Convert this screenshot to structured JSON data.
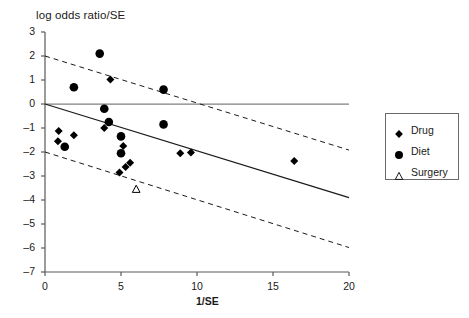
{
  "chart_data": {
    "type": "scatter",
    "title": "log odds ratio/SE",
    "xlabel": "1/SE",
    "ylabel": "",
    "xlim": [
      0,
      20
    ],
    "ylim": [
      -7,
      3
    ],
    "xticks": [
      "0",
      "5",
      "10",
      "15",
      "20"
    ],
    "xtick_values": [
      0,
      5,
      10,
      15,
      20
    ],
    "yticks": [
      "3",
      "2",
      "1",
      "0",
      "–1",
      "–2",
      "–3",
      "–4",
      "–5",
      "–6",
      "–7"
    ],
    "ytick_values": [
      3,
      2,
      1,
      0,
      -1,
      -2,
      -3,
      -4,
      -5,
      -6,
      -7
    ],
    "grid": false,
    "legend_position": "right-outside",
    "series": [
      {
        "name": "Drug",
        "marker": "filled-diamond",
        "color": "#000000",
        "points": [
          [
            4.3,
            1.02
          ],
          [
            0.9,
            -1.12
          ],
          [
            1.9,
            -1.3
          ],
          [
            0.85,
            -1.55
          ],
          [
            3.9,
            -1.0
          ],
          [
            5.15,
            -1.75
          ],
          [
            8.9,
            -2.05
          ],
          [
            9.6,
            -2.02
          ],
          [
            16.4,
            -2.37
          ],
          [
            5.6,
            -2.45
          ],
          [
            5.3,
            -2.62
          ],
          [
            4.9,
            -2.85
          ]
        ]
      },
      {
        "name": "Diet",
        "marker": "filled-circle",
        "color": "#000000",
        "points": [
          [
            3.6,
            2.1
          ],
          [
            1.9,
            0.7
          ],
          [
            7.8,
            0.6
          ],
          [
            3.9,
            -0.2
          ],
          [
            4.2,
            -0.75
          ],
          [
            7.8,
            -0.85
          ],
          [
            5.0,
            -1.35
          ],
          [
            5.0,
            -2.05
          ],
          [
            1.3,
            -1.78
          ]
        ]
      },
      {
        "name": "Surgery",
        "marker": "open-triangle",
        "color": "#000000",
        "points": [
          [
            6.0,
            -3.55
          ]
        ]
      }
    ],
    "lines": [
      {
        "name": "zero-reference-line",
        "style": "solid",
        "color": "#808080",
        "x0": 0,
        "y0": 0,
        "x1": 20,
        "y1": 0
      },
      {
        "name": "regression-line",
        "style": "solid",
        "color": "#1a1a1a",
        "x0": 0,
        "y0": 0,
        "x1": 20,
        "y1": -3.9
      },
      {
        "name": "upper-confidence-bound",
        "style": "dashed",
        "color": "#1a1a1a",
        "x0": 0,
        "y0": 2.0,
        "x1": 20,
        "y1": -1.92
      },
      {
        "name": "lower-confidence-bound",
        "style": "dashed",
        "color": "#1a1a1a",
        "x0": 0,
        "y0": -2.0,
        "x1": 20,
        "y1": -5.98
      }
    ]
  },
  "legend": {
    "entries": [
      {
        "label": "Drug",
        "marker": "filled-diamond"
      },
      {
        "label": "Diet",
        "marker": "filled-circle"
      },
      {
        "label": "Surgery",
        "marker": "open-triangle"
      }
    ]
  }
}
